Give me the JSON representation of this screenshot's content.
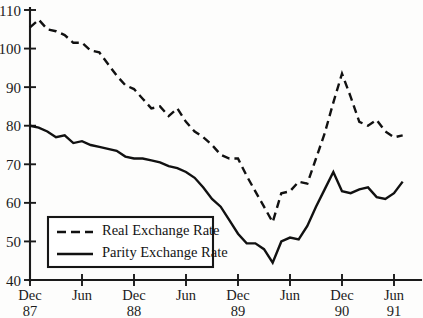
{
  "chart_data": {
    "type": "line",
    "title": "",
    "xlabel": "",
    "ylabel": "",
    "ylim": [
      40,
      110
    ],
    "y_ticks": [
      40,
      50,
      60,
      70,
      80,
      90,
      100,
      110
    ],
    "grid": false,
    "legend_position": "lower-left",
    "x_tick_labels": [
      "Dec",
      "Jun",
      "Dec",
      "Jun",
      "Dec",
      "Jun",
      "Dec",
      "Jun"
    ],
    "x_year_labels": [
      "87",
      "",
      "88",
      "",
      "89",
      "",
      "90",
      "91"
    ],
    "x_axis_months": [
      "Dec 87",
      "Jun 88",
      "Dec 88",
      "Jun 89",
      "Dec 89",
      "Jun 90",
      "Dec 90",
      "Jun 91"
    ],
    "series": [
      {
        "name": "Real Exchange Rate",
        "style": "dashed",
        "color": "#111111",
        "x": [
          "Dec 87",
          "Jan 88",
          "Feb 88",
          "Mar 88",
          "Apr 88",
          "May 88",
          "Jun 88",
          "Jul 88",
          "Aug 88",
          "Sep 88",
          "Oct 88",
          "Nov 88",
          "Dec 88",
          "Jan 89",
          "Feb 89",
          "Mar 89",
          "Apr 89",
          "May 89",
          "Jun 89",
          "Jul 89",
          "Aug 89",
          "Sep 89",
          "Oct 89",
          "Nov 89",
          "Dec 89",
          "Jan 90",
          "Feb 90",
          "Mar 90",
          "Apr 90",
          "May 90",
          "Jun 90",
          "Jul 90",
          "Aug 90",
          "Sep 90",
          "Oct 90",
          "Nov 90",
          "Dec 90",
          "Jan 91",
          "Feb 91",
          "Mar 91",
          "Apr 91",
          "May 91",
          "Jun 91",
          "Jul 91"
        ],
        "values": [
          105.5,
          107.5,
          105.0,
          104.5,
          103.5,
          101.5,
          101.5,
          99.5,
          99.0,
          96.0,
          93.0,
          90.5,
          89.5,
          87.0,
          84.5,
          85.0,
          82.5,
          84.5,
          81.0,
          78.5,
          77.0,
          75.0,
          72.5,
          71.5,
          71.5,
          67.0,
          63.0,
          59.0,
          55.0,
          62.5,
          63.0,
          65.5,
          65.0,
          71.5,
          78.0,
          86.0,
          93.5,
          87.5,
          81.0,
          80.0,
          81.5,
          78.5,
          77.0,
          77.5
        ]
      },
      {
        "name": "Parity Exchange Rate",
        "style": "solid",
        "color": "#111111",
        "x": [
          "Dec 87",
          "Jan 88",
          "Feb 88",
          "Mar 88",
          "Apr 88",
          "May 88",
          "Jun 88",
          "Jul 88",
          "Aug 88",
          "Sep 88",
          "Oct 88",
          "Nov 88",
          "Dec 88",
          "Jan 89",
          "Feb 89",
          "Mar 89",
          "Apr 89",
          "May 89",
          "Jun 89",
          "Jul 89",
          "Aug 89",
          "Sep 89",
          "Oct 89",
          "Nov 89",
          "Dec 89",
          "Jan 90",
          "Feb 90",
          "Mar 90",
          "Apr 90",
          "May 90",
          "Jun 90",
          "Jul 90",
          "Aug 90",
          "Sep 90",
          "Oct 90",
          "Nov 90",
          "Dec 90",
          "Jan 91",
          "Feb 91",
          "Mar 91",
          "Apr 91",
          "May 91",
          "Jun 91",
          "Jul 91"
        ],
        "values": [
          80.0,
          79.5,
          78.5,
          77.0,
          77.5,
          75.5,
          76.0,
          75.0,
          74.5,
          74.0,
          73.5,
          72.0,
          71.5,
          71.5,
          71.0,
          70.5,
          69.5,
          69.0,
          68.0,
          66.5,
          64.0,
          61.0,
          59.0,
          55.5,
          52.0,
          49.5,
          49.5,
          48.0,
          44.5,
          50.0,
          51.0,
          50.5,
          54.0,
          59.0,
          63.5,
          68.0,
          63.0,
          62.5,
          63.5,
          64.0,
          61.5,
          61.0,
          62.5,
          65.5
        ]
      }
    ],
    "legend": [
      {
        "label": "Real Exchange Rate",
        "style": "dashed"
      },
      {
        "label": "Parity Exchange Rate",
        "style": "solid"
      }
    ]
  }
}
